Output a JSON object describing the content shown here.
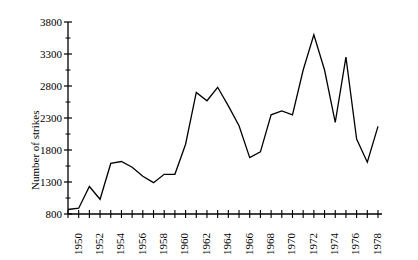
{
  "chart_data": {
    "type": "line",
    "title": "",
    "subtitle": "",
    "xlabel": "",
    "ylabel": "Number of strikes",
    "xlim": [
      1950,
      1979
    ],
    "ylim": [
      800,
      3800
    ],
    "grid": false,
    "legend": null,
    "y_ticks": [
      800,
      1300,
      1800,
      2300,
      2800,
      3300,
      3800
    ],
    "x_ticks": [
      1950,
      1952,
      1954,
      1956,
      1958,
      1960,
      1962,
      1964,
      1966,
      1968,
      1970,
      1972,
      1974,
      1976,
      1978
    ],
    "x_tick_labels": [
      "1950",
      "1952",
      "1954",
      "1956",
      "1958",
      "1960",
      "1962",
      "1964",
      "1966",
      "1968",
      "1970",
      "1972",
      "1974",
      "1976",
      "1978"
    ],
    "y_tick_labels": [
      "800",
      "1300",
      "1800",
      "2300",
      "2800",
      "3300",
      "3800"
    ],
    "x_minor_tick_interval": 1,
    "line_color": "#000000",
    "axis_color": "#000000",
    "background_color": "#ffffff",
    "x": [
      1950,
      1951,
      1952,
      1953,
      1954,
      1955,
      1956,
      1957,
      1958,
      1959,
      1960,
      1961,
      1962,
      1963,
      1964,
      1965,
      1966,
      1967,
      1968,
      1969,
      1970,
      1971,
      1972,
      1973,
      1974,
      1975,
      1976,
      1977,
      1978,
      1979
    ],
    "values": [
      870,
      890,
      1230,
      1030,
      1590,
      1620,
      1530,
      1390,
      1290,
      1420,
      1420,
      1890,
      2700,
      2570,
      2780,
      2490,
      2180,
      1680,
      1770,
      2350,
      2410,
      2350,
      3050,
      3600,
      3050,
      2230,
      3250,
      1970,
      1610,
      2170
    ],
    "annotations": []
  },
  "axis_label_y": "Number of strikes"
}
